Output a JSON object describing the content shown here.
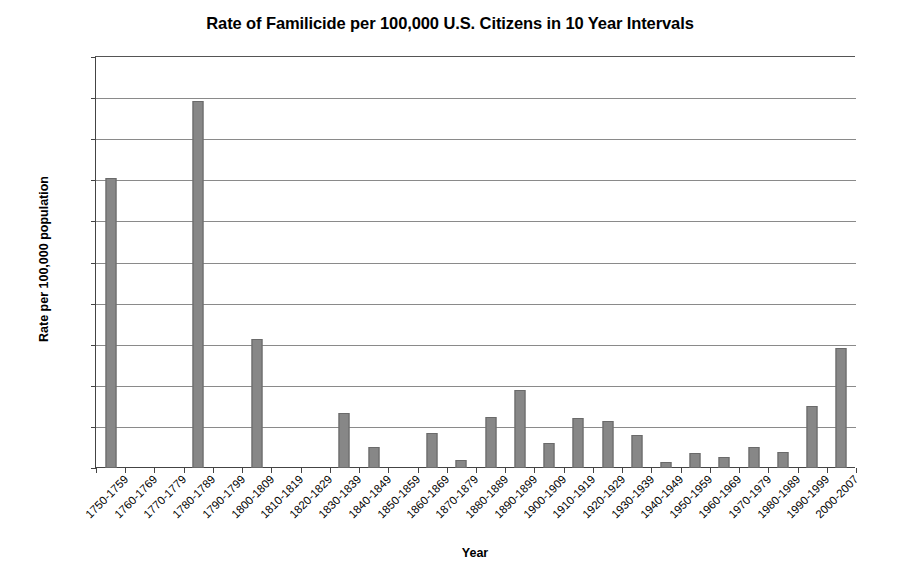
{
  "chart_data": {
    "type": "bar",
    "title": "Rate of Familicide per 100,000 U.S. Citizens in 10 Year Intervals",
    "xlabel": "Year",
    "ylabel": "Rate per 100,000 population",
    "ylim": [
      0,
      0.1
    ],
    "grid": true,
    "legend": "none",
    "ytick_labels": [
      "0.100",
      "0.090",
      "0.080",
      "0.070",
      "0.060",
      "0.050",
      "0.040",
      "0.030",
      "0.020",
      "0.010",
      "0.000"
    ],
    "ytick_values": [
      0.1,
      0.09,
      0.08,
      0.07,
      0.06,
      0.05,
      0.04,
      0.03,
      0.02,
      0.01,
      0.0
    ],
    "categories": [
      "1750-1759",
      "1760-1769",
      "1770-1779",
      "1780-1789",
      "1790-1799",
      "1800-1809",
      "1810-1819",
      "1820-1829",
      "1830-1839",
      "1840-1849",
      "1850-1859",
      "1860-1869",
      "1870-1879",
      "1880-1889",
      "1890-1899",
      "1900-1909",
      "1910-1919",
      "1920-1929",
      "1930-1939",
      "1940-1949",
      "1950-1959",
      "1960-1969",
      "1970-1979",
      "1980-1989",
      "1990-1999",
      "2000-2007"
    ],
    "values": [
      0.0705,
      0.0,
      0.0,
      0.0893,
      0.0,
      0.0315,
      0.0,
      0.0,
      0.0135,
      0.005,
      0.0,
      0.0085,
      0.002,
      0.0123,
      0.019,
      0.006,
      0.0122,
      0.0115,
      0.008,
      0.0015,
      0.0037,
      0.0027,
      0.005,
      0.004,
      0.015,
      0.0292
    ],
    "bar_color": "#7b7b7b",
    "axis_color": "#444444",
    "grid_color": "#8a8a8a",
    "background_color": "#ffffff"
  }
}
